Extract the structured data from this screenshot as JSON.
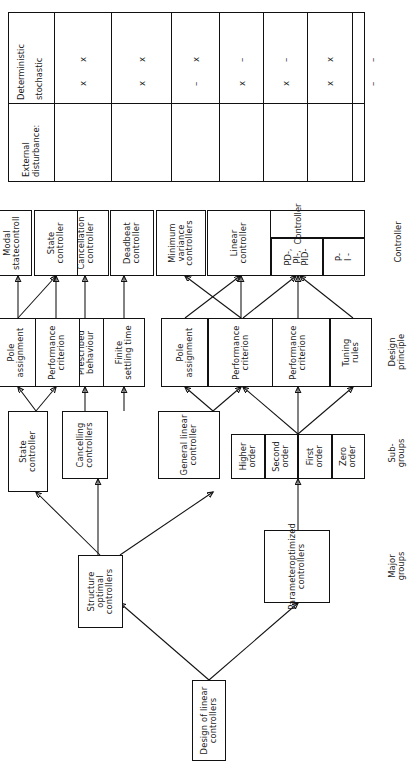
{
  "figure": {
    "root": {
      "label": "Design of linear controllers"
    },
    "major_groups": [
      {
        "id": "param",
        "label": "Parameteroptimized\ncontrollers"
      },
      {
        "id": "structure",
        "label": "Structure optimal\ncontrollers"
      }
    ],
    "sub_groups": [
      {
        "id": "orders",
        "cells": [
          "Zero\norder",
          "First\norder",
          "Second\norder",
          "Higher\norder"
        ]
      },
      {
        "id": "general-linear",
        "label": "General linear\ncontroller"
      },
      {
        "id": "cancelling",
        "label": "Cancelling\ncontrollers"
      },
      {
        "id": "state",
        "label": "State\ncontroller"
      }
    ],
    "design_principles": [
      {
        "id": "tuning-rules",
        "label": "Tuning\nrules"
      },
      {
        "id": "perf-crit-param",
        "label": "Performance\ncriterion"
      },
      {
        "id": "pole-assign-param",
        "label": "Pole\nassignment"
      },
      {
        "id": "perf-crit-gl",
        "label": "Performance\ncriterion"
      },
      {
        "id": "pole-assign-gl",
        "label": "Pole\nassignment"
      },
      {
        "id": "prescribed",
        "label": "Prescribed\nbehaviour"
      },
      {
        "id": "finite-settling",
        "label": "Finite\nsettling time"
      },
      {
        "id": "perf-crit-state",
        "label": "Performance\ncriterion"
      },
      {
        "id": "pole-assign-state",
        "label": "Pole\nassignment"
      }
    ],
    "controllers": [
      {
        "id": "pi-pid",
        "cells": [
          "P-\nI -",
          "PD-,\nPI-,\nPID-",
          "General\nlinear"
        ],
        "group_label": "Controller"
      },
      {
        "id": "linear",
        "label": "Linear\ncontroller"
      },
      {
        "id": "minvar",
        "label": "Minimum\nvariance\ncontrollers"
      },
      {
        "id": "cancellation",
        "label": "Cancellation\ncontroller"
      },
      {
        "id": "deadbeat",
        "label": "Deadbeat\ncontroller"
      },
      {
        "id": "state-ctrl",
        "label": "State\ncontroller"
      },
      {
        "id": "modal",
        "label": "Modal\nstatecontroll"
      }
    ],
    "row_labels": [
      {
        "id": "major-groups",
        "label": "Major\ngroups"
      },
      {
        "id": "sub-groups",
        "label": "Sub-\ngroups"
      },
      {
        "id": "design-principle",
        "label": "Design\nprinciple"
      },
      {
        "id": "controller",
        "label": "Controller"
      }
    ]
  },
  "table": {
    "header": {
      "title": "External\ndisturbance:",
      "rows": [
        "Deterministic",
        "stochastic"
      ]
    },
    "columns": [
      {
        "id": "pi-pid",
        "deterministic": "x",
        "stochastic": "x"
      },
      {
        "id": "linear",
        "deterministic": "x",
        "stochastic": "x"
      },
      {
        "id": "minvar",
        "deterministic": "–",
        "stochastic": "x"
      },
      {
        "id": "cancellation",
        "deterministic": "x",
        "stochastic": "–"
      },
      {
        "id": "deadbeat",
        "deterministic": "x",
        "stochastic": "–"
      },
      {
        "id": "state-ctrl",
        "deterministic": "x",
        "stochastic": "x"
      },
      {
        "id": "modal",
        "deterministic": "–",
        "stochastic": "–"
      }
    ]
  }
}
